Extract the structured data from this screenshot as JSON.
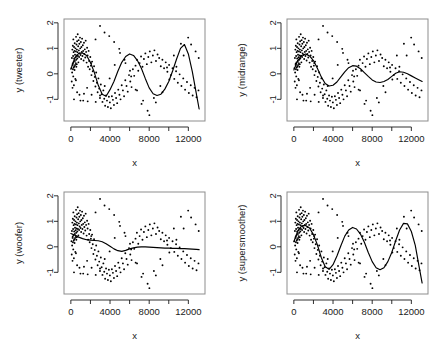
{
  "figure": {
    "layout": "2x2 panel grid",
    "background": "#ffffff",
    "point_color": "#000000",
    "line_color": "#000000",
    "frame_color": "#8d8d8d"
  },
  "chart_data": [
    {
      "type": "scatter",
      "panel": 0,
      "title": "",
      "xlabel": "x",
      "ylabel": "y (tweeter)",
      "xlim": [
        -700,
        13700
      ],
      "ylim": [
        -1.85,
        2.15
      ],
      "xticks": [
        0,
        4000,
        8000,
        12000
      ],
      "xticklabels": [
        "0",
        "4000",
        "8000",
        "12000"
      ],
      "xminorticks": [
        2000,
        6000,
        10000
      ],
      "yticks": [
        -1,
        0,
        1,
        2
      ],
      "yticklabels": [
        "-1",
        "0",
        "1",
        "2"
      ],
      "grid": false,
      "legend": null,
      "series": [
        {
          "name": "observations",
          "type": "scatter",
          "x": [
            60,
            90,
            110,
            130,
            150,
            170,
            190,
            200,
            215,
            230,
            245,
            255,
            270,
            285,
            300,
            310,
            325,
            340,
            355,
            370,
            380,
            395,
            410,
            425,
            440,
            455,
            470,
            485,
            500,
            515,
            530,
            545,
            560,
            575,
            590,
            605,
            620,
            640,
            660,
            680,
            700,
            720,
            745,
            770,
            795,
            820,
            845,
            870,
            900,
            930,
            960,
            990,
            1020,
            1050,
            1080,
            1115,
            1150,
            1185,
            1220,
            1260,
            1300,
            1340,
            1380,
            1425,
            1470,
            1515,
            1560,
            1610,
            1660,
            1710,
            1760,
            1815,
            1870,
            1925,
            1985,
            2045,
            2105,
            2170,
            2235,
            2300,
            2370,
            2440,
            2510,
            2585,
            2660,
            2735,
            2815,
            2895,
            2975,
            3060,
            3145,
            3230,
            3320,
            3410,
            3500,
            3595,
            3690,
            3785,
            3885,
            3985,
            4085,
            4190,
            4295,
            4400,
            4510,
            4620,
            4730,
            4845,
            4960,
            5075,
            5195,
            5315,
            5435,
            5560,
            5685,
            5810,
            5940,
            6070,
            6200,
            6335,
            6470,
            6605,
            6745,
            6885,
            7025,
            7170,
            7315,
            7460,
            7610,
            7760,
            7910,
            8065,
            8220,
            8375,
            8535,
            8695,
            8855,
            9020,
            9185,
            9350,
            9520,
            9690,
            9860,
            10035,
            10210,
            10385,
            10565,
            10745,
            10925,
            11110,
            11295,
            11480,
            11670,
            11860,
            12050,
            12245,
            12440,
            12635,
            12835,
            13035,
            320,
            640,
            980,
            1340,
            1720,
            2120,
            2540,
            2980,
            3440,
            3920,
            4420,
            4940,
            5480,
            6040,
            6620,
            7220,
            7840,
            8480,
            9140,
            9820,
            10520,
            11240,
            11980,
            12740,
            180,
            520,
            880,
            1260,
            1660,
            2080,
            2520,
            2980,
            3460,
            3960,
            4480,
            5020,
            5580,
            6160,
            6760,
            7380,
            8020,
            8680,
            9360,
            10060,
            10780,
            11520,
            12280,
            13060
          ],
          "y": [
            0.22,
            -0.3,
            0.62,
            0.05,
            0.95,
            -0.55,
            0.4,
            1.1,
            0.18,
            0.7,
            -0.1,
            1.35,
            0.45,
            0.85,
            0.25,
            -0.45,
            1.05,
            0.6,
            0.3,
            0.9,
            0.15,
            1.2,
            0.5,
            0.75,
            0.35,
            -0.2,
            1.0,
            0.65,
            0.42,
            0.88,
            1.45,
            0.55,
            0.28,
            1.15,
            0.72,
            0.38,
            0.95,
            1.28,
            0.6,
            0.85,
            1.55,
            0.7,
            1.08,
            0.45,
            1.32,
            0.92,
            0.66,
            1.18,
            0.8,
            1.42,
            1.0,
            0.74,
            1.25,
            0.58,
            1.05,
            0.86,
            1.38,
            0.7,
            1.12,
            0.9,
            0.52,
            1.22,
            0.78,
            0.96,
            0.64,
            1.3,
            0.86,
            0.44,
            1.02,
            0.72,
            0.28,
            0.9,
            0.5,
            0.18,
            0.66,
            0.32,
            -0.05,
            0.48,
            0.1,
            -0.28,
            0.3,
            -0.12,
            -0.5,
            0.05,
            -0.35,
            -0.72,
            -0.18,
            -0.58,
            -0.95,
            -0.42,
            -0.8,
            -1.1,
            -0.65,
            -0.98,
            -1.25,
            -0.85,
            -1.05,
            -1.3,
            -0.9,
            -1.12,
            -1.35,
            -0.88,
            -1.02,
            -1.22,
            -0.75,
            -0.95,
            -1.15,
            -0.62,
            -0.82,
            -1.0,
            -0.45,
            -0.65,
            -0.88,
            -0.25,
            -0.48,
            -0.7,
            -0.05,
            -0.3,
            -0.52,
            0.18,
            -0.08,
            0.32,
            0.55,
            0.12,
            0.42,
            0.68,
            0.28,
            0.58,
            0.8,
            0.38,
            0.66,
            0.88,
            0.45,
            0.72,
            0.92,
            0.5,
            0.76,
            0.62,
            0.3,
            0.55,
            0.22,
            0.45,
            0.08,
            0.35,
            -0.05,
            0.22,
            -0.2,
            0.1,
            -0.35,
            -0.02,
            -0.48,
            -0.18,
            -0.62,
            -0.32,
            -0.75,
            -0.45,
            -0.85,
            -0.55,
            -0.92,
            -0.65,
            -1.0,
            -0.72,
            -1.05,
            -0.78,
            -1.08,
            -0.82,
            -1.1,
            -0.85,
            1.62,
            1.48,
            1.25,
            0.98,
            0.55,
            0.12,
            -0.62,
            -1.18,
            -1.45,
            -0.95,
            -0.48,
            0.25,
            0.72,
            1.18,
            1.42,
            0.88,
            0.35,
            -0.25,
            -0.82,
            -1.05,
            -0.55,
            0.42,
            1.35,
            1.88,
            -0.48,
            -0.18,
            0.35,
            0.82,
            0.42,
            -0.1,
            -0.65,
            -1.05,
            -1.62,
            -1.12,
            -0.72,
            -0.22,
            0.28,
            0.72,
            1.15,
            0.62,
            0.18,
            -0.38,
            -0.88,
            -1.2,
            -0.72,
            0.12,
            0.95,
            -1.48
          ]
        },
        {
          "name": "tweeter smooth",
          "type": "line",
          "x": [
            0,
            400,
            800,
            1200,
            1600,
            2000,
            2400,
            2800,
            3200,
            3600,
            4000,
            4400,
            4800,
            5200,
            5600,
            6000,
            6400,
            6800,
            7200,
            7600,
            8000,
            8400,
            8800,
            9200,
            9600,
            10000,
            10400,
            10800,
            11200,
            11600,
            12000,
            12400,
            12800,
            13100
          ],
          "y": [
            0.18,
            0.62,
            0.8,
            0.82,
            0.72,
            0.45,
            0.05,
            -0.45,
            -0.8,
            -0.88,
            -0.62,
            -0.3,
            0.1,
            0.45,
            0.68,
            0.78,
            0.72,
            0.52,
            0.22,
            -0.18,
            -0.55,
            -0.78,
            -0.85,
            -0.8,
            -0.6,
            -0.3,
            0.12,
            0.58,
            1.0,
            1.15,
            0.78,
            0.1,
            -0.75,
            -1.38
          ]
        }
      ]
    },
    {
      "type": "scatter",
      "panel": 1,
      "title": "",
      "xlabel": "x",
      "ylabel": "y (midrange)",
      "xlim": [
        -700,
        13700
      ],
      "ylim": [
        -1.85,
        2.15
      ],
      "xticks": [
        0,
        4000,
        8000,
        12000
      ],
      "xticklabels": [
        "0",
        "4000",
        "8000",
        "12000"
      ],
      "xminorticks": [
        2000,
        6000,
        10000
      ],
      "yticks": [
        -1,
        0,
        1,
        2
      ],
      "yticklabels": [
        "-1",
        "0",
        "1",
        "2"
      ],
      "grid": false,
      "legend": null,
      "series": [
        {
          "name": "midrange smooth",
          "type": "line",
          "x": [
            0,
            400,
            800,
            1200,
            1600,
            2000,
            2400,
            2800,
            3200,
            3600,
            4000,
            4400,
            4800,
            5200,
            5600,
            6000,
            6400,
            6800,
            7200,
            7600,
            8000,
            8400,
            8800,
            9200,
            9600,
            10000,
            10400,
            10800,
            11200,
            11600,
            12000,
            12400,
            12800,
            13100
          ],
          "y": [
            0.15,
            0.52,
            0.72,
            0.78,
            0.7,
            0.52,
            0.22,
            -0.12,
            -0.38,
            -0.48,
            -0.45,
            -0.32,
            -0.12,
            0.08,
            0.24,
            0.32,
            0.3,
            0.2,
            0.05,
            -0.1,
            -0.24,
            -0.32,
            -0.34,
            -0.3,
            -0.22,
            -0.1,
            0.02,
            0.08,
            0.06,
            0.0,
            -0.08,
            -0.16,
            -0.24,
            -0.3
          ]
        }
      ]
    },
    {
      "type": "scatter",
      "panel": 2,
      "title": "",
      "xlabel": "x",
      "ylabel": "y (woofer)",
      "xlim": [
        -700,
        13700
      ],
      "ylim": [
        -1.85,
        2.15
      ],
      "xticks": [
        0,
        4000,
        8000,
        12000
      ],
      "xticklabels": [
        "0",
        "4000",
        "8000",
        "12000"
      ],
      "xminorticks": [
        2000,
        6000,
        10000
      ],
      "yticks": [
        -1,
        0,
        1,
        2
      ],
      "yticklabels": [
        "-1",
        "0",
        "1",
        "2"
      ],
      "grid": false,
      "legend": null,
      "series": [
        {
          "name": "woofer smooth",
          "type": "line",
          "x": [
            0,
            400,
            800,
            1200,
            1600,
            2000,
            2400,
            2800,
            3200,
            3600,
            4000,
            4400,
            4800,
            5200,
            5600,
            6000,
            6400,
            6800,
            7200,
            7600,
            8000,
            8400,
            8800,
            9200,
            9600,
            10000,
            10400,
            10800,
            11200,
            11600,
            12000,
            12400,
            12800,
            13100
          ],
          "y": [
            0.52,
            0.46,
            0.38,
            0.32,
            0.28,
            0.26,
            0.25,
            0.24,
            0.2,
            0.12,
            0.02,
            -0.08,
            -0.15,
            -0.18,
            -0.14,
            -0.08,
            -0.04,
            -0.01,
            0.0,
            0.0,
            -0.01,
            -0.02,
            -0.03,
            -0.04,
            -0.05,
            -0.05,
            -0.06,
            -0.06,
            -0.07,
            -0.07,
            -0.08,
            -0.09,
            -0.1,
            -0.11
          ]
        }
      ]
    },
    {
      "type": "scatter",
      "panel": 3,
      "title": "",
      "xlabel": "x",
      "ylabel": "y (supersmoother)",
      "xlim": [
        -700,
        13700
      ],
      "ylim": [
        -1.85,
        2.15
      ],
      "xticks": [
        0,
        4000,
        8000,
        12000
      ],
      "xticklabels": [
        "0",
        "4000",
        "8000",
        "12000"
      ],
      "xminorticks": [
        2000,
        6000,
        10000
      ],
      "yticks": [
        -1,
        0,
        1,
        2
      ],
      "yticklabels": [
        "-1",
        "0",
        "1",
        "2"
      ],
      "grid": false,
      "legend": null,
      "series": [
        {
          "name": "supersmoother smooth",
          "type": "line",
          "x": [
            0,
            400,
            800,
            1200,
            1600,
            2000,
            2400,
            2800,
            3200,
            3600,
            4000,
            4400,
            4800,
            5200,
            5600,
            6000,
            6400,
            6800,
            7200,
            7600,
            8000,
            8400,
            8800,
            9200,
            9600,
            10000,
            10400,
            10800,
            11200,
            11600,
            12000,
            12400,
            12800,
            13100
          ],
          "y": [
            0.2,
            0.62,
            0.82,
            0.84,
            0.74,
            0.48,
            0.08,
            -0.42,
            -0.78,
            -0.88,
            -0.7,
            -0.36,
            0.04,
            0.42,
            0.66,
            0.76,
            0.7,
            0.5,
            0.18,
            -0.22,
            -0.58,
            -0.82,
            -0.9,
            -0.82,
            -0.58,
            -0.22,
            0.24,
            0.66,
            0.92,
            0.9,
            0.6,
            0.06,
            -0.8,
            -1.42
          ]
        }
      ]
    }
  ]
}
